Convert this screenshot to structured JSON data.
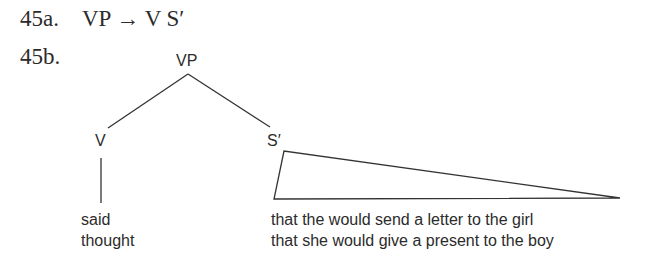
{
  "example_a": {
    "number": "45a.",
    "rule": "VP → V S′"
  },
  "example_b": {
    "number": "45b."
  },
  "tree": {
    "root": "VP",
    "left_node": "V",
    "right_node": "S′",
    "left_words": [
      "said",
      "thought"
    ],
    "right_words": [
      "that the would send a letter to the girl",
      "that she would give a present to the boy"
    ]
  }
}
